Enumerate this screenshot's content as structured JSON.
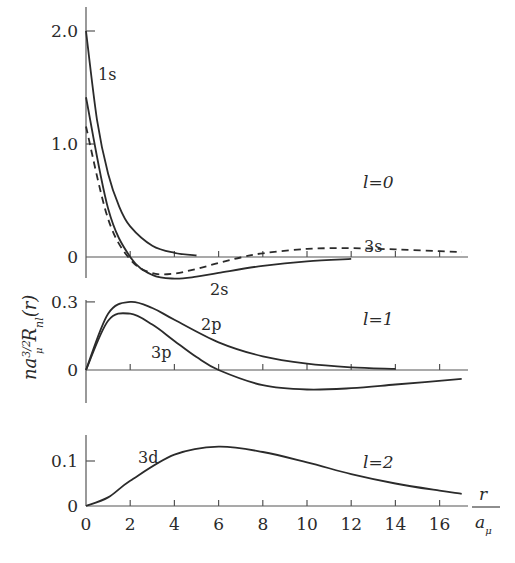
{
  "chart_data": {
    "type": "line",
    "title": "",
    "xlabel": "r / a_μ",
    "xlabel_num": "r",
    "xlabel_den": "a_μ",
    "ylabel": "n a_μ^{3/2} R_nl(r)",
    "xlim": [
      0,
      17.3
    ],
    "x_ticks": [
      0,
      2,
      4,
      6,
      8,
      10,
      12,
      14,
      16
    ],
    "panels": [
      {
        "id": "l0",
        "label": "l=0",
        "ylim": [
          -0.22,
          2.2
        ],
        "y_ticks": [
          {
            "value": 0,
            "label": "0"
          },
          {
            "value": 1.0,
            "label": "1.0"
          },
          {
            "value": 2.0,
            "label": "2.0"
          }
        ],
        "series": [
          {
            "name": "1s",
            "style": "solid",
            "x": [
              0,
              0.5,
              1,
              1.5,
              2,
              3,
              4,
              5
            ],
            "y": [
              2.0,
              1.213,
              0.736,
              0.446,
              0.271,
              0.1,
              0.037,
              0.013
            ]
          },
          {
            "name": "2s",
            "style": "solid",
            "x": [
              0,
              1,
              2,
              3,
              4,
              5,
              6,
              8,
              10,
              12
            ],
            "y": [
              1.414,
              0.429,
              0.0,
              -0.158,
              -0.191,
              -0.174,
              -0.141,
              -0.078,
              -0.038,
              -0.017
            ]
          },
          {
            "name": "3s",
            "style": "dashed",
            "x": [
              0,
              1,
              2,
              3,
              4,
              5,
              6,
              7,
              8,
              10,
              12,
              14,
              16,
              17
            ],
            "y": [
              1.155,
              0.337,
              -0.022,
              -0.142,
              -0.146,
              -0.105,
              -0.052,
              -0.004,
              0.033,
              0.072,
              0.078,
              0.067,
              0.052,
              0.044
            ]
          }
        ]
      },
      {
        "id": "l1",
        "label": "l=1",
        "ylim": [
          -0.15,
          0.31
        ],
        "y_ticks": [
          {
            "value": 0,
            "label": "0"
          },
          {
            "value": 0.3,
            "label": "0.3"
          }
        ],
        "series": [
          {
            "name": "2p",
            "style": "solid",
            "x": [
              0,
              1,
              2,
              3,
              4,
              6,
              8,
              10,
              12,
              14
            ],
            "y": [
              0.0,
              0.248,
              0.3,
              0.273,
              0.221,
              0.122,
              0.06,
              0.028,
              0.012,
              0.005
            ]
          },
          {
            "name": "3p",
            "style": "solid",
            "x": [
              0,
              1,
              2,
              3,
              4,
              5,
              6,
              8,
              10,
              12,
              14,
              17
            ],
            "y": [
              0.0,
              0.217,
              0.248,
              0.2,
              0.128,
              0.057,
              0.0,
              -0.067,
              -0.086,
              -0.08,
              -0.064,
              -0.039
            ]
          }
        ]
      },
      {
        "id": "l2",
        "label": "l=2",
        "ylim": [
          0,
          0.16
        ],
        "y_ticks": [
          {
            "value": 0,
            "label": "0"
          },
          {
            "value": 0.1,
            "label": "0.1"
          }
        ],
        "series": [
          {
            "name": "3d",
            "style": "solid",
            "x": [
              0,
              1,
              2,
              4,
              6,
              8,
              10,
              12,
              14,
              16,
              17
            ],
            "y": [
              0.0,
              0.019,
              0.056,
              0.114,
              0.132,
              0.12,
              0.097,
              0.071,
              0.05,
              0.034,
              0.027
            ]
          }
        ]
      }
    ],
    "legend": "none (inline curve labels)",
    "grid": false
  },
  "labels": {
    "l0": "l=0",
    "l1": "l=1",
    "l2": "l=2",
    "s1": "1s",
    "s2": "2s",
    "s3": "3s",
    "p2": "2p",
    "p3": "3p",
    "d3": "3d"
  }
}
